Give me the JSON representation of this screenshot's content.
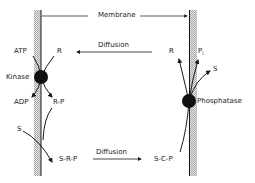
{
  "diagram": {
    "membrane_label": "Membrane",
    "top_diffusion_label": "Diffusion",
    "bottom_diffusion_label": "Diffusion",
    "left_side": {
      "enzyme": "Kinase",
      "inputs": [
        "ATP",
        "R"
      ],
      "outputs": [
        "ADP",
        "R-P"
      ],
      "substrate": "S",
      "product": "S-R-P"
    },
    "right_side": {
      "enzyme": "Phosphatase",
      "input": "S-C-P",
      "outputs": [
        "R",
        "P",
        "S"
      ],
      "pi_subscript": "i"
    },
    "colors": {
      "ink": "#1a1a1a",
      "membrane_hatch": "#bdbdbd",
      "background": "#ffffff"
    }
  }
}
